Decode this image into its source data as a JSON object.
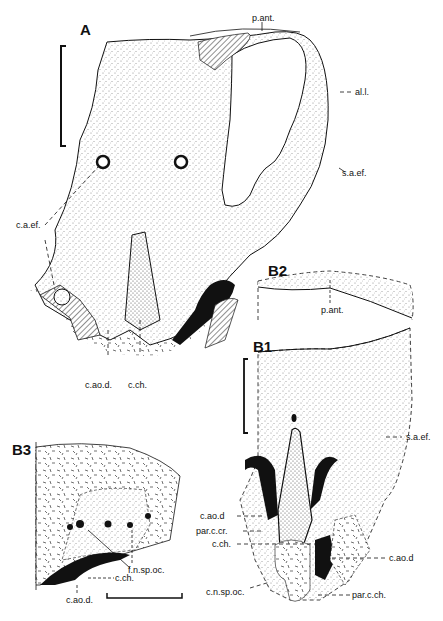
{
  "figure": {
    "panels": {
      "A": "A",
      "B1": "B1",
      "B2": "B2",
      "B3": "B3"
    },
    "labels": {
      "A": {
        "p_ant": "p.ant.",
        "al_l": "al.l.",
        "s_a_ef": "s.a.ef.",
        "c_a_ef": "c.a.ef.",
        "c_ao_d": "c.ao.d.",
        "c_ch": "c.ch."
      },
      "B2": {
        "p_ant": "p.ant."
      },
      "B1": {
        "s_a_ef": "s.a.ef.",
        "c_ao_d_left": "c.ao.d",
        "par_c_cr": "par.c.cr.",
        "c_ch": "c.ch.",
        "c_ao_d_right": "c.ao.d",
        "c_n_sp_oc": "c.n.sp.oc.",
        "par_c_ch": "par.c.ch."
      },
      "B3": {
        "f_n_sp_oc": "f.n.sp.oc.",
        "c_ch": "c.ch.",
        "c_ao_d": "c.ao.d."
      }
    },
    "colors": {
      "ink": "#111111",
      "stipple": "#cfcfcf",
      "background": "#ffffff"
    }
  }
}
